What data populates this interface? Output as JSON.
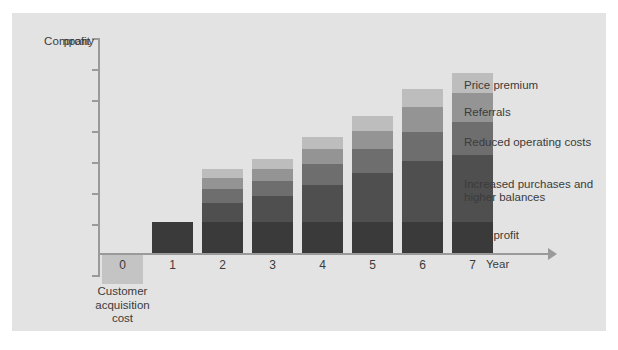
{
  "chart_data": {
    "type": "bar",
    "stacked": true,
    "title": "",
    "xlabel": "Year",
    "ylabel": "Company profit",
    "grid": false,
    "legend_position": "right-inline",
    "axis": {
      "y_ticks_count": 6,
      "y_axis_label_line1": "Company",
      "y_axis_label_line2": "profit",
      "x_axis_label": "Year"
    },
    "categories": [
      "0",
      "1",
      "2",
      "3",
      "4",
      "5",
      "6",
      "7"
    ],
    "series": [
      {
        "name": "Base profit",
        "color": "#3a3a3a",
        "values": [
          0,
          28,
          28,
          28,
          28,
          28,
          28,
          28
        ]
      },
      {
        "name": "Increased purchases and higher balances",
        "color": "#4f4f4f",
        "values": [
          0,
          0,
          18,
          24,
          34,
          45,
          56,
          62
        ]
      },
      {
        "name": "Reduced operating costs",
        "color": "#6e6e6e",
        "values": [
          0,
          0,
          13,
          14,
          20,
          22,
          27,
          30
        ]
      },
      {
        "name": "Referrals",
        "color": "#949494",
        "values": [
          0,
          0,
          10,
          11,
          13,
          17,
          23,
          27
        ]
      },
      {
        "name": "Price premium",
        "color": "#bdbdbd",
        "values": [
          0,
          0,
          8,
          9,
          11,
          14,
          16,
          18
        ]
      }
    ],
    "below_axis": {
      "name": "Customer acquisition cost",
      "category": "0",
      "color": "#c4c4c4",
      "value": -29,
      "label_line1": "Customer",
      "label_line2": "acquisition",
      "label_line3": "cost"
    },
    "legend_entries": [
      {
        "label": "Price premium",
        "color": "#bdbdbd"
      },
      {
        "label": "Referrals",
        "color": "#949494"
      },
      {
        "label": "Reduced operating costs",
        "color": "#6e6e6e"
      },
      {
        "label": "Increased purchases and",
        "color": "#4f4f4f"
      },
      {
        "label": "higher balances",
        "color": "#4f4f4f"
      },
      {
        "label": "Base profit",
        "color": "#3a3a3a"
      }
    ],
    "colors": {
      "panel_background": "#e3e3e3",
      "page_background": "#ffffff",
      "axis": "#9a9a9a",
      "text": "#3b3b3b"
    }
  },
  "legend": {
    "price_premium": "Price premium",
    "referrals": "Referrals",
    "reduced_operating_costs": "Reduced operating costs",
    "increased_purchases_line1": "Increased purchases and",
    "increased_purchases_line2": "higher balances",
    "base_profit": "Base profit"
  },
  "axis_labels": {
    "y_line1": "Company",
    "y_line2": "profit",
    "x_title": "Year",
    "cac_line1": "Customer",
    "cac_line2": "acquisition",
    "cac_line3": "cost",
    "x0": "0",
    "x1": "1",
    "x2": "2",
    "x3": "3",
    "x4": "4",
    "x5": "5",
    "x6": "6",
    "x7": "7"
  }
}
